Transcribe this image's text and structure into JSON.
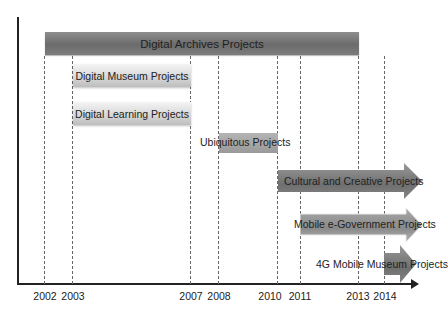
{
  "diagram": {
    "type": "timeline",
    "axis": {
      "years": [
        {
          "label": "2002",
          "x": 45
        },
        {
          "label": "2003",
          "x": 73
        },
        {
          "label": "2007",
          "x": 191
        },
        {
          "label": "2008",
          "x": 219
        },
        {
          "label": "2010",
          "x": 278
        },
        {
          "label": "2011",
          "x": 301
        },
        {
          "label": "2013",
          "x": 359
        },
        {
          "label": "2014",
          "x": 385
        }
      ]
    },
    "projects": [
      {
        "label": "Digital Archives Projects",
        "start": "2002",
        "end": "2013",
        "style": "dark-bar"
      },
      {
        "label": "Digital Museum Projects",
        "start": "2003",
        "end": "2007",
        "style": "light-bar"
      },
      {
        "label": "Digital Learning Projects",
        "start": "2003",
        "end": "2007",
        "style": "light-bar"
      },
      {
        "label": "Ubiquitous Projects",
        "start": "2008",
        "end": "2010",
        "style": "mid-bar"
      },
      {
        "label": "Cultural and Creative Projects",
        "start": "2010",
        "end": "ongoing",
        "style": "dark-arrow"
      },
      {
        "label": "Mobile e-Government  Projects",
        "start": "2011",
        "end": "ongoing",
        "style": "dark-arrow"
      },
      {
        "label": "4G Mobile Museum Projects",
        "start": "2014",
        "end": "ongoing",
        "style": "dark-arrow"
      }
    ],
    "colors": {
      "axis": "#222222",
      "dark_bar": "#7a7a7a",
      "light_bar": "#d6d6d6",
      "dashed_line": "#666666"
    }
  }
}
